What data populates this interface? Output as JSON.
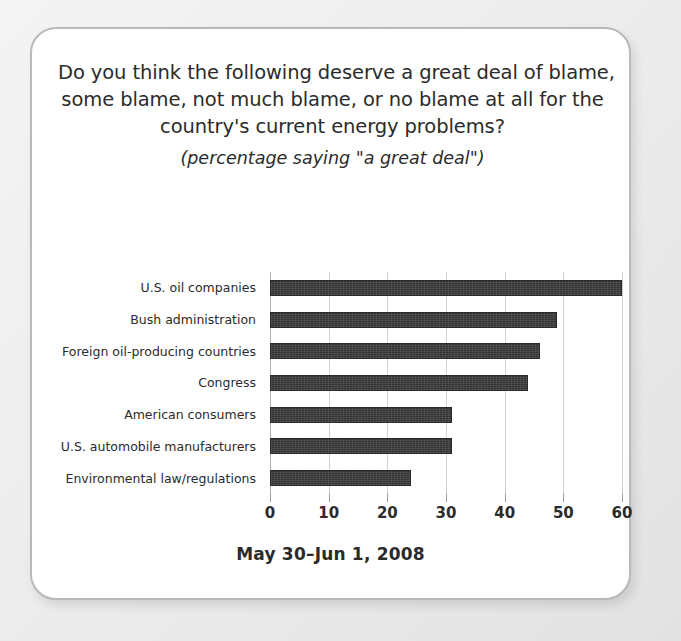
{
  "card": {
    "title_lines": [
      "Do you think the following deserve a great deal of blame,",
      "some blame, not much blame, or no blame at all for the",
      "country's current energy problems?"
    ],
    "subtitle": "(percentage saying \"a great deal\")",
    "footer_date": "May 30–Jun 1, 2008"
  },
  "colors": {
    "bar": "#333333",
    "gridline": "#d2d2d2",
    "card_border": "#b9b9b9",
    "text": "#2b2b2b"
  },
  "chart_data": {
    "type": "bar",
    "orientation": "horizontal",
    "title": "Do you think the following deserve a great deal of blame, some blame, not much blame, or no blame at all for the country's current energy problems?",
    "subtitle": "(percentage saying \"a great deal\")",
    "categories": [
      "U.S. oil companies",
      "Bush administration",
      "Foreign oil-producing countries",
      "Congress",
      "American consumers",
      "U.S. automobile manufacturers",
      "Environmental law/regulations"
    ],
    "values": [
      60,
      49,
      46,
      44,
      31,
      31,
      24
    ],
    "xlabel": "",
    "ylabel": "",
    "xlim": [
      0,
      60
    ],
    "xticks": [
      0,
      10,
      20,
      30,
      40,
      50,
      60
    ],
    "xtick_labels": [
      "0",
      "10",
      "20",
      "30",
      "40",
      "50",
      "60"
    ],
    "grid": "vertical",
    "legend": "none",
    "annotation": "May 30–Jun 1, 2008"
  }
}
